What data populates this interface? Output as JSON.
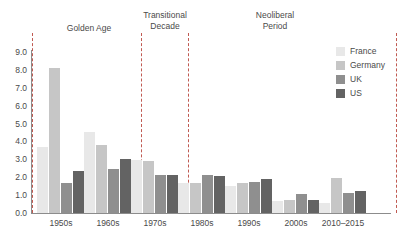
{
  "chart_data": {
    "type": "bar",
    "title": "",
    "subtitle": "",
    "xlabel": "",
    "ylabel": "",
    "ylim": [
      0.0,
      9.0
    ],
    "ytick_labels": [
      "9.0",
      "8.0",
      "7.0",
      "6.0",
      "5.0",
      "4.0",
      "3.0",
      "2.0",
      "1.0",
      "0.0"
    ],
    "ytick_values": [
      9.0,
      8.0,
      7.0,
      6.0,
      5.0,
      4.0,
      3.0,
      2.0,
      1.0,
      0.0
    ],
    "grid": false,
    "legend_position": "right",
    "categories": [
      "1950s",
      "1960s",
      "1970s",
      "1980s",
      "1990s",
      "2000s",
      "2010–2015"
    ],
    "series": [
      {
        "name": "France",
        "color": "#e8e8e8",
        "values": [
          3.7,
          4.55,
          2.95,
          1.65,
          1.5,
          0.65,
          0.55
        ]
      },
      {
        "name": "Germany",
        "color": "#c6c6c6",
        "values": [
          8.1,
          3.8,
          2.9,
          1.65,
          1.7,
          0.75,
          1.95
        ]
      },
      {
        "name": "UK",
        "color": "#8f8f8f",
        "values": [
          1.7,
          2.45,
          2.15,
          2.15,
          1.75,
          1.05,
          1.1
        ]
      },
      {
        "name": "US",
        "color": "#636363",
        "values": [
          2.35,
          3.0,
          2.15,
          2.05,
          1.9,
          0.75,
          1.25
        ]
      }
    ],
    "annotations": [
      {
        "name": "golden-age",
        "text": "Golden Age",
        "x_start": "1950s",
        "x_end": "1960s"
      },
      {
        "name": "transitional",
        "text": "Transitional\nDecade",
        "x_start": "1970s",
        "x_end": "1970s"
      },
      {
        "name": "neoliberal-period",
        "text": "Neoliberal\nPeriod",
        "x_start": "1980s",
        "x_end": "2010–2015"
      }
    ],
    "dividers": 4
  },
  "regions": {
    "golden_age": "Golden Age",
    "transitional_decade": "Transitional\nDecade",
    "neoliberal_period": "Neoliberal\nPeriod"
  },
  "axis": {
    "y_ticks": [
      "9.0",
      "8.0",
      "7.0",
      "6.0",
      "5.0",
      "4.0",
      "3.0",
      "2.0",
      "1.0",
      "0.0"
    ],
    "x_ticks": [
      "1950s",
      "1960s",
      "1970s",
      "1980s",
      "1990s",
      "2000s",
      "2010–2015"
    ]
  },
  "legend": {
    "items": [
      {
        "label": "France",
        "color": "#e8e8e8"
      },
      {
        "label": "Germany",
        "color": "#c6c6c6"
      },
      {
        "label": "UK",
        "color": "#8f8f8f"
      },
      {
        "label": "US",
        "color": "#636363"
      }
    ]
  }
}
